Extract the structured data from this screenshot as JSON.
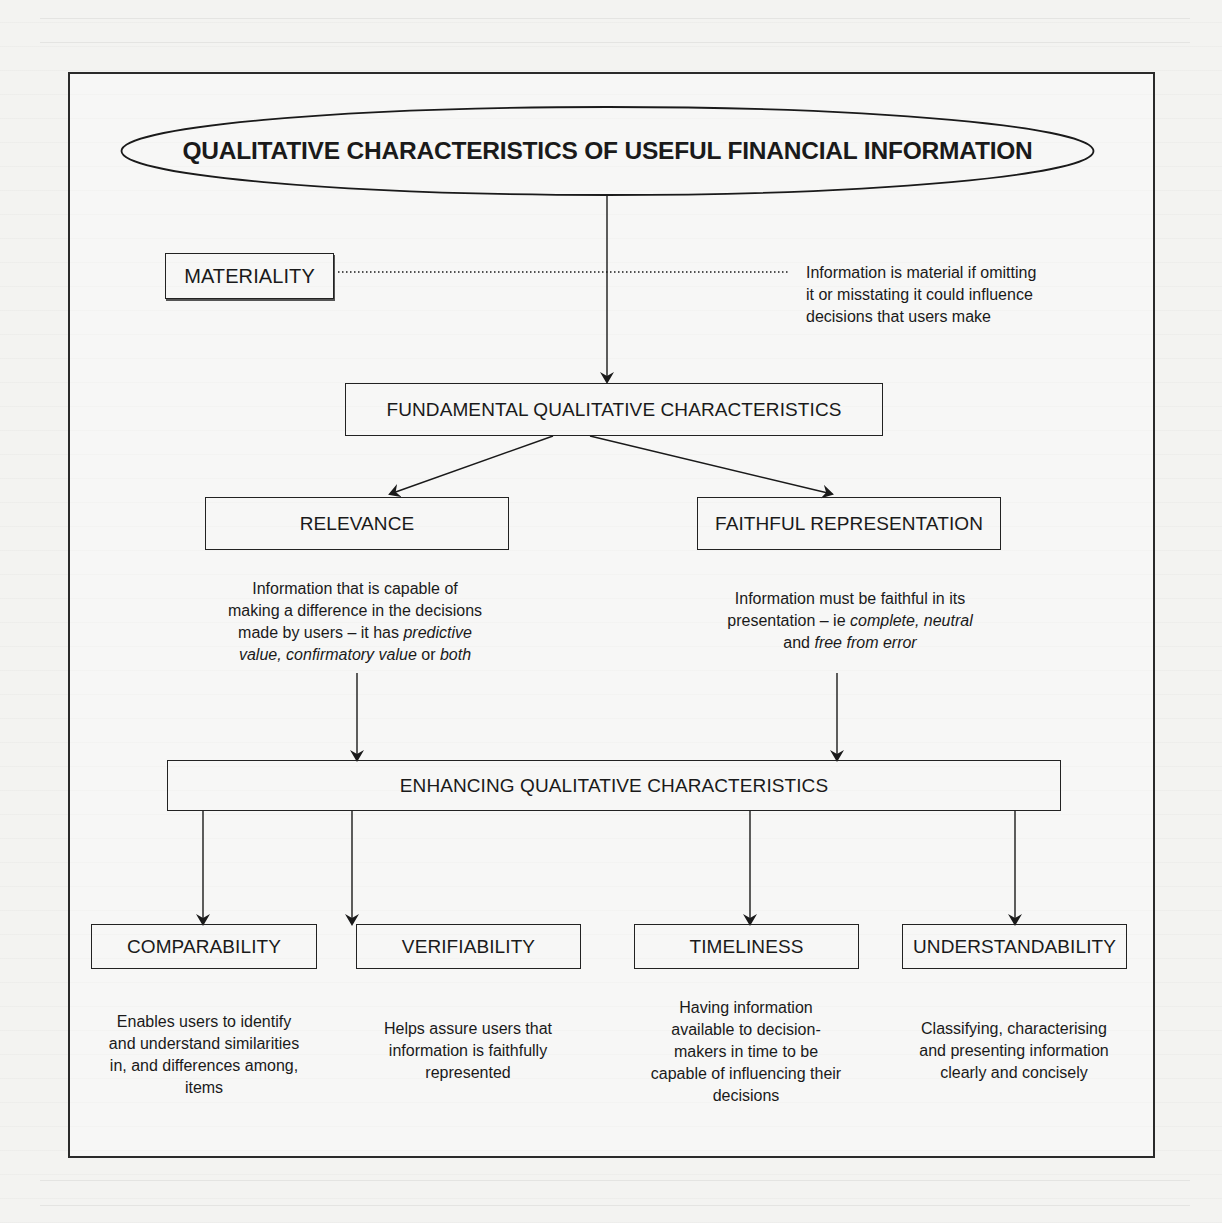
{
  "diagram": {
    "title": "QUALITATIVE CHARACTERISTICS OF USEFUL FINANCIAL INFORMATION",
    "materiality": {
      "label": "MATERIALITY",
      "description_lines": [
        "Information is material if omitting",
        "it or misstating it could influence",
        "decisions that users make"
      ]
    },
    "fundamental": {
      "label": "FUNDAMENTAL QUALITATIVE CHARACTERISTICS",
      "children": [
        {
          "label": "RELEVANCE",
          "description": {
            "line1": "Information that is capable of",
            "line2": "making a difference in the decisions",
            "line3_prefix": "made by users – it has ",
            "line3_italic": "predictive",
            "line4_italic_a": "value, confirmatory value",
            "line4_mid": " or ",
            "line4_italic_b": "both"
          }
        },
        {
          "label": "FAITHFUL REPRESENTATION",
          "description": {
            "line1": "Information must be faithful in its",
            "line2_prefix": "presentation – ie ",
            "line2_italic": "complete, neutral",
            "line3_prefix": "and ",
            "line3_italic": "free from error"
          }
        }
      ]
    },
    "enhancing": {
      "label": "ENHANCING QUALITATIVE CHARACTERISTICS",
      "children": [
        {
          "label": "COMPARABILITY",
          "description_lines": [
            "Enables users to identify",
            "and understand similarities",
            "in, and differences among,",
            "items"
          ]
        },
        {
          "label": "VERIFIABILITY",
          "description_lines": [
            "Helps assure users that",
            "information is faithfully",
            "represented"
          ]
        },
        {
          "label": "TIMELINESS",
          "description_lines": [
            "Having information",
            "available to decision-",
            "makers in time to be",
            "capable of influencing their",
            "decisions"
          ]
        },
        {
          "label": "UNDERSTANDABILITY",
          "description_lines": [
            "Classifying, characterising",
            "and presenting information",
            "clearly and concisely"
          ]
        }
      ]
    },
    "colors": {
      "ink": "#1a1a1a",
      "paper": "#f3f3f1"
    }
  }
}
